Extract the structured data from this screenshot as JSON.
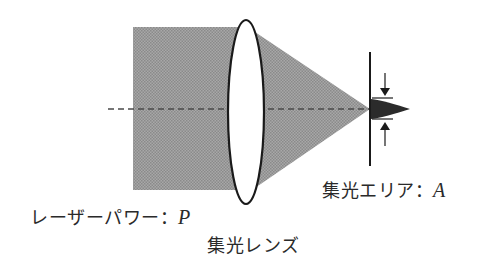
{
  "diagram": {
    "labels": {
      "laser_power": {
        "text": "レーザーパワー：",
        "var": "P"
      },
      "lens": {
        "text": "集光レンズ"
      },
      "focus_area": {
        "text": "集光エリア：",
        "var": "A"
      }
    },
    "colors": {
      "beam_fill": "#9a9a9a",
      "focus_spot": "#2b2b2b",
      "stroke": "#1a1a1a",
      "axis_dash": "#4a4a4a",
      "background": "#ffffff"
    }
  }
}
